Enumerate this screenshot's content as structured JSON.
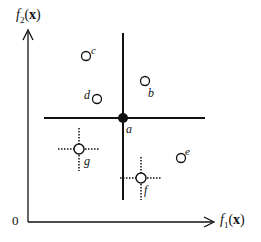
{
  "diagram": {
    "type": "pareto-dominance-illustration",
    "axes": {
      "x_label_fn": "f",
      "x_label_sub": "1",
      "x_label_arg": "x",
      "y_label_fn": "f",
      "y_label_sub": "2",
      "y_label_arg": "x",
      "origin_label": "0"
    },
    "reference_point": {
      "label": "a",
      "style": "filled"
    },
    "points": [
      {
        "label": "a",
        "style": "filled"
      },
      {
        "label": "b",
        "style": "open"
      },
      {
        "label": "c",
        "style": "open"
      },
      {
        "label": "d",
        "style": "open"
      },
      {
        "label": "e",
        "style": "open"
      },
      {
        "label": "f",
        "style": "open-dotted-cross"
      },
      {
        "label": "g",
        "style": "open-dotted-cross"
      }
    ],
    "colors": {
      "stroke": "#111111",
      "background": "#ffffff"
    }
  }
}
